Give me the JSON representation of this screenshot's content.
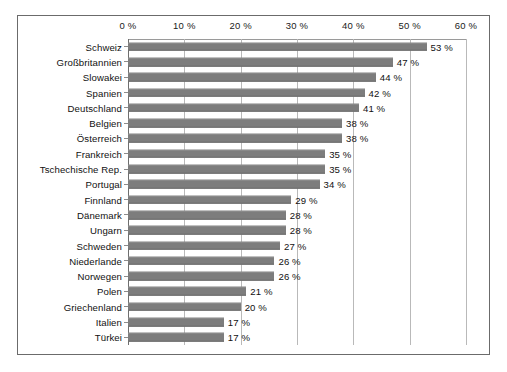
{
  "chart_data": {
    "type": "bar",
    "orientation": "horizontal",
    "title": "",
    "xlabel": "",
    "ylabel": "",
    "xlim": [
      0,
      60
    ],
    "grid": true,
    "legend": "none",
    "xticks": [
      "0 %",
      "10 %",
      "20 %",
      "30 %",
      "40 %",
      "50 %",
      "60 %"
    ],
    "xtick_values": [
      0,
      10,
      20,
      30,
      40,
      50,
      60
    ],
    "categories": [
      "Schweiz",
      "Großbritannien",
      "Slowakei",
      "Spanien",
      "Deutschland",
      "Belgien",
      "Österreich",
      "Frankreich",
      "Tschechische Rep.",
      "Portugal",
      "Finnland",
      "Dänemark",
      "Ungarn",
      "Schweden",
      "Niederlande",
      "Norwegen",
      "Polen",
      "Griechenland",
      "Italien",
      "Türkei"
    ],
    "values": [
      53,
      47,
      44,
      42,
      41,
      38,
      38,
      35,
      35,
      34,
      29,
      28,
      28,
      27,
      26,
      26,
      21,
      20,
      17,
      17
    ],
    "value_labels": [
      "53 %",
      "47 %",
      "44 %",
      "42 %",
      "41 %",
      "38 %",
      "38 %",
      "35 %",
      "35 %",
      "34 %",
      "29 %",
      "28 %",
      "28 %",
      "27 %",
      "26 %",
      "26 %",
      "21 %",
      "20 %",
      "17 %",
      "17 %"
    ],
    "colors": {
      "bar": "#7d7d7d",
      "gridline": "#b9b9b9",
      "border": "#6b6b6b",
      "text": "#111111",
      "background": "#ffffff"
    }
  }
}
